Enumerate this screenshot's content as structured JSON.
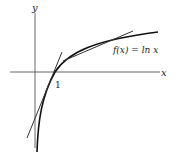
{
  "diagram": {
    "axes": {
      "x_label": "x",
      "y_label": "y",
      "tick_label": "1"
    },
    "curve": {
      "label": "f(x) = ln x",
      "function": "ln x"
    },
    "tangent_lines": [
      {
        "description": "tangent line at x = 1 (slope 1)"
      },
      {
        "description": "secant/tangent line near upper part of curve"
      }
    ],
    "colors": {
      "axis": "#555555",
      "curve": "#111111",
      "lines": "#333333"
    }
  }
}
